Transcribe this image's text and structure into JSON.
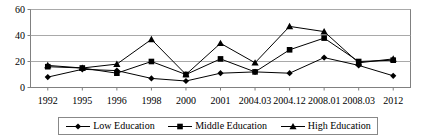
{
  "chart_data": {
    "type": "line",
    "title": "",
    "xlabel": "",
    "ylabel": "",
    "categories": [
      "1992",
      "1995",
      "1996",
      "1998",
      "2000",
      "2001",
      "2004.03",
      "2004.12",
      "2008.01",
      "2008.03",
      "2012"
    ],
    "ylim": [
      0,
      60
    ],
    "yticks": [
      0,
      20,
      40,
      60
    ],
    "ytick_labels": [
      "0",
      "20",
      "40",
      "60"
    ],
    "grid": "horizontal",
    "legend_position": "bottom",
    "series": [
      {
        "name": "Low Education",
        "marker": "diamond",
        "color": "#000000",
        "values": [
          8,
          14,
          13,
          7,
          5,
          11,
          12,
          11,
          23,
          17,
          9
        ]
      },
      {
        "name": "Middle Education",
        "marker": "square",
        "color": "#000000",
        "values": [
          16,
          15,
          11,
          20,
          10,
          22,
          12,
          29,
          38,
          20,
          21
        ]
      },
      {
        "name": "High Education",
        "marker": "triangle",
        "color": "#000000",
        "values": [
          17,
          15,
          18,
          37,
          10,
          34,
          19,
          47,
          43,
          19,
          22
        ]
      }
    ]
  },
  "axis": {
    "frame_color": "#808080",
    "grid_color": "#a9a9a9",
    "line_color": "#000000"
  }
}
